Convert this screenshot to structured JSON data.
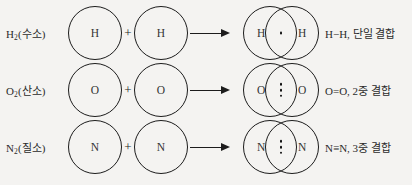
{
  "diagram": {
    "background_color": "#f4f3f1",
    "line_color": "#1c1c1c",
    "text_color": "#2b2b2b",
    "plus_symbol": "+",
    "rows": [
      {
        "reactant_label": "H",
        "reactant_subscript": "2",
        "reactant_name": "(수소)",
        "atom_left_symbol": "H",
        "atom_right_symbol": "H",
        "product_left_symbol": "H",
        "product_right_symbol": "H",
        "shared_electron_dots": 1,
        "bond_label": "H−H, 단일 결합"
      },
      {
        "reactant_label": "O",
        "reactant_subscript": "2",
        "reactant_name": "(산소)",
        "atom_left_symbol": "O",
        "atom_right_symbol": "O",
        "product_left_symbol": "O",
        "product_right_symbol": "O",
        "shared_electron_dots": 3,
        "bond_label": "O=O, 2중 결합"
      },
      {
        "reactant_label": "N",
        "reactant_subscript": "2",
        "reactant_name": "(질소)",
        "atom_left_symbol": "N",
        "atom_right_symbol": "N",
        "product_left_symbol": "N",
        "product_right_symbol": "N",
        "shared_electron_dots": 3,
        "bond_label": "N≡N, 3중 결합"
      }
    ]
  }
}
